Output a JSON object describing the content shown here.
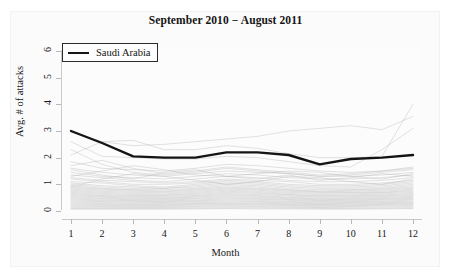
{
  "chart_data": {
    "type": "line",
    "title": "September 2010 − August 2011",
    "xlabel": "Month",
    "ylabel": "Avg. # of attacks",
    "xlim": [
      1,
      12
    ],
    "ylim": [
      0,
      6
    ],
    "x": [
      1,
      2,
      3,
      4,
      5,
      6,
      7,
      8,
      9,
      10,
      11,
      12
    ],
    "xticks": [
      "1",
      "2",
      "3",
      "4",
      "5",
      "6",
      "7",
      "8",
      "9",
      "10",
      "11",
      "12"
    ],
    "yticks": [
      "0",
      "1",
      "2",
      "3",
      "4",
      "5",
      "6"
    ],
    "grid": false,
    "legend_position": "top-left",
    "legend": [
      "Saudi Arabia"
    ],
    "highlight_color": "#141414",
    "background_line_color": "#b4b4b4",
    "series": [
      {
        "name": "Saudi Arabia",
        "highlight": true,
        "color": "#141414",
        "width": 2.4,
        "values": [
          3.0,
          2.55,
          2.05,
          2.0,
          2.0,
          2.2,
          2.2,
          2.1,
          1.75,
          1.95,
          2.0,
          2.1
        ]
      },
      {
        "name": "background-country-1",
        "highlight": false,
        "values": [
          2.95,
          2.6,
          2.45,
          2.5,
          2.6,
          2.7,
          2.8,
          3.0,
          3.1,
          3.2,
          3.05,
          3.55
        ]
      },
      {
        "name": "background-country-2",
        "highlight": false,
        "values": [
          2.1,
          2.6,
          2.65,
          2.3,
          2.3,
          2.45,
          2.35,
          2.15,
          2.0,
          2.0,
          2.05,
          4.0
        ]
      },
      {
        "name": "background-country-3",
        "highlight": false,
        "values": [
          2.6,
          2.05,
          2.0,
          1.95,
          1.95,
          2.05,
          2.0,
          1.85,
          1.7,
          1.65,
          2.3,
          3.1
        ]
      },
      {
        "name": "background-country-4",
        "highlight": false,
        "values": [
          1.85,
          1.6,
          1.55,
          1.5,
          1.6,
          1.75,
          1.7,
          1.6,
          1.5,
          1.45,
          1.5,
          1.65
        ]
      },
      {
        "name": "background-country-5",
        "highlight": false,
        "values": [
          1.6,
          1.45,
          1.35,
          1.3,
          1.4,
          1.5,
          1.45,
          1.4,
          1.3,
          1.3,
          1.35,
          1.45
        ]
      },
      {
        "name": "background-country-6",
        "highlight": false,
        "values": [
          1.45,
          1.3,
          1.25,
          1.2,
          1.3,
          1.4,
          1.35,
          1.25,
          1.2,
          1.2,
          1.25,
          1.35
        ]
      },
      {
        "name": "background-country-7",
        "highlight": false,
        "values": [
          1.35,
          1.25,
          1.15,
          1.1,
          1.2,
          1.3,
          1.25,
          1.15,
          1.1,
          1.1,
          1.15,
          1.25
        ]
      },
      {
        "name": "background-country-8",
        "highlight": false,
        "values": [
          1.25,
          1.15,
          1.1,
          1.05,
          1.1,
          1.2,
          1.15,
          1.1,
          1.0,
          1.0,
          1.05,
          1.15
        ]
      },
      {
        "name": "background-country-9",
        "highlight": false,
        "values": [
          1.2,
          1.1,
          1.0,
          1.0,
          1.05,
          1.15,
          1.1,
          1.0,
          0.95,
          0.95,
          1.0,
          1.1
        ]
      },
      {
        "name": "background-country-10",
        "highlight": false,
        "values": [
          1.1,
          1.05,
          0.95,
          0.9,
          1.0,
          1.1,
          1.05,
          0.95,
          0.9,
          0.9,
          0.95,
          1.05
        ]
      },
      {
        "name": "background-country-11",
        "highlight": false,
        "values": [
          1.05,
          0.95,
          0.9,
          0.85,
          0.95,
          1.05,
          1.0,
          0.9,
          0.85,
          0.85,
          0.9,
          1.0
        ]
      },
      {
        "name": "background-country-12",
        "highlight": false,
        "values": [
          1.0,
          0.9,
          0.85,
          0.85,
          0.9,
          1.0,
          0.95,
          0.85,
          0.8,
          0.8,
          0.85,
          0.95
        ]
      },
      {
        "name": "background-country-13",
        "highlight": false,
        "values": [
          0.95,
          0.85,
          0.8,
          0.8,
          0.85,
          0.95,
          0.9,
          0.8,
          0.75,
          0.78,
          0.82,
          0.9
        ]
      },
      {
        "name": "background-country-14",
        "highlight": false,
        "values": [
          0.9,
          0.82,
          0.78,
          0.75,
          0.82,
          0.9,
          0.85,
          0.78,
          0.72,
          0.74,
          0.78,
          0.86
        ]
      },
      {
        "name": "background-country-15",
        "highlight": false,
        "values": [
          0.86,
          0.78,
          0.74,
          0.72,
          0.78,
          0.86,
          0.82,
          0.74,
          0.7,
          0.7,
          0.74,
          0.82
        ]
      },
      {
        "name": "background-country-16",
        "highlight": false,
        "values": [
          0.82,
          0.74,
          0.7,
          0.68,
          0.74,
          0.82,
          0.78,
          0.7,
          0.66,
          0.68,
          0.7,
          0.78
        ]
      },
      {
        "name": "background-country-17",
        "highlight": false,
        "values": [
          0.78,
          0.7,
          0.66,
          0.64,
          0.7,
          0.78,
          0.74,
          0.66,
          0.62,
          0.64,
          0.68,
          0.74
        ]
      },
      {
        "name": "background-country-18",
        "highlight": false,
        "values": [
          0.74,
          0.66,
          0.62,
          0.6,
          0.66,
          0.74,
          0.7,
          0.62,
          0.58,
          0.6,
          0.64,
          0.7
        ]
      },
      {
        "name": "background-country-19",
        "highlight": false,
        "values": [
          0.7,
          0.62,
          0.58,
          0.58,
          0.62,
          0.7,
          0.66,
          0.6,
          0.55,
          0.57,
          0.6,
          0.66
        ]
      },
      {
        "name": "background-country-20",
        "highlight": false,
        "values": [
          0.66,
          0.58,
          0.55,
          0.54,
          0.58,
          0.66,
          0.62,
          0.56,
          0.52,
          0.54,
          0.57,
          0.62
        ]
      },
      {
        "name": "background-country-21",
        "highlight": false,
        "values": [
          0.62,
          0.55,
          0.52,
          0.5,
          0.55,
          0.62,
          0.58,
          0.52,
          0.48,
          0.5,
          0.54,
          0.58
        ]
      },
      {
        "name": "background-country-22",
        "highlight": false,
        "values": [
          0.58,
          0.52,
          0.48,
          0.47,
          0.52,
          0.58,
          0.55,
          0.49,
          0.45,
          0.47,
          0.5,
          0.55
        ]
      },
      {
        "name": "background-country-23",
        "highlight": false,
        "values": [
          0.54,
          0.48,
          0.45,
          0.44,
          0.48,
          0.54,
          0.51,
          0.46,
          0.42,
          0.44,
          0.47,
          0.51
        ]
      },
      {
        "name": "background-country-24",
        "highlight": false,
        "values": [
          0.5,
          0.45,
          0.42,
          0.41,
          0.45,
          0.5,
          0.47,
          0.43,
          0.39,
          0.41,
          0.44,
          0.48
        ]
      },
      {
        "name": "background-country-25",
        "highlight": false,
        "values": [
          0.46,
          0.41,
          0.39,
          0.38,
          0.41,
          0.46,
          0.44,
          0.4,
          0.36,
          0.38,
          0.41,
          0.44
        ]
      },
      {
        "name": "background-country-26",
        "highlight": false,
        "values": [
          0.42,
          0.38,
          0.36,
          0.35,
          0.38,
          0.42,
          0.4,
          0.36,
          0.33,
          0.35,
          0.37,
          0.41
        ]
      },
      {
        "name": "background-country-27",
        "highlight": false,
        "values": [
          0.38,
          0.35,
          0.33,
          0.32,
          0.35,
          0.38,
          0.36,
          0.33,
          0.3,
          0.32,
          0.34,
          0.37
        ]
      },
      {
        "name": "background-country-28",
        "highlight": false,
        "values": [
          0.34,
          0.31,
          0.29,
          0.29,
          0.31,
          0.34,
          0.33,
          0.3,
          0.27,
          0.29,
          0.31,
          0.33
        ]
      },
      {
        "name": "background-country-29",
        "highlight": false,
        "values": [
          0.3,
          0.28,
          0.26,
          0.26,
          0.28,
          0.3,
          0.29,
          0.27,
          0.24,
          0.26,
          0.28,
          0.3
        ]
      },
      {
        "name": "background-country-30",
        "highlight": false,
        "values": [
          0.26,
          0.24,
          0.23,
          0.23,
          0.25,
          0.27,
          0.26,
          0.24,
          0.22,
          0.23,
          0.25,
          0.27
        ]
      },
      {
        "name": "background-country-31",
        "highlight": false,
        "values": [
          0.22,
          0.21,
          0.2,
          0.2,
          0.22,
          0.24,
          0.23,
          0.21,
          0.19,
          0.2,
          0.22,
          0.24
        ]
      },
      {
        "name": "background-country-32",
        "highlight": false,
        "values": [
          0.18,
          0.17,
          0.17,
          0.17,
          0.18,
          0.2,
          0.19,
          0.18,
          0.16,
          0.17,
          0.19,
          0.2
        ]
      },
      {
        "name": "background-country-33",
        "highlight": false,
        "values": [
          0.14,
          0.14,
          0.13,
          0.13,
          0.15,
          0.16,
          0.16,
          0.14,
          0.13,
          0.14,
          0.15,
          0.16
        ]
      },
      {
        "name": "background-country-34",
        "highlight": false,
        "values": [
          0.1,
          0.1,
          0.1,
          0.1,
          0.11,
          0.12,
          0.12,
          0.11,
          0.1,
          0.1,
          0.11,
          0.12
        ]
      },
      {
        "name": "background-country-35",
        "highlight": false,
        "values": [
          0.07,
          0.07,
          0.07,
          0.07,
          0.08,
          0.09,
          0.08,
          0.08,
          0.07,
          0.07,
          0.08,
          0.09
        ]
      },
      {
        "name": "background-country-36",
        "highlight": false,
        "values": [
          1.7,
          1.9,
          1.6,
          1.4,
          1.5,
          1.65,
          1.55,
          1.45,
          1.35,
          1.4,
          1.5,
          1.6
        ]
      },
      {
        "name": "background-country-37",
        "highlight": false,
        "values": [
          2.3,
          1.75,
          1.45,
          1.35,
          1.45,
          1.6,
          1.5,
          1.4,
          1.3,
          1.35,
          1.45,
          1.55
        ]
      },
      {
        "name": "background-country-38",
        "highlight": false,
        "values": [
          1.3,
          1.5,
          1.7,
          1.55,
          1.35,
          1.3,
          1.4,
          1.5,
          1.45,
          1.3,
          1.2,
          1.4
        ]
      },
      {
        "name": "background-country-39",
        "highlight": false,
        "values": [
          0.9,
          1.2,
          1.4,
          1.3,
          1.15,
          1.0,
          1.1,
          1.3,
          1.25,
          1.1,
          1.0,
          1.2
        ]
      },
      {
        "name": "background-country-40",
        "highlight": false,
        "values": [
          1.55,
          1.35,
          1.2,
          1.45,
          1.55,
          1.3,
          1.2,
          1.35,
          1.15,
          1.25,
          1.4,
          1.3
        ]
      }
    ]
  }
}
